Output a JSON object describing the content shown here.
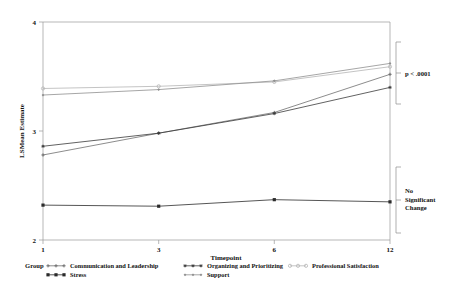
{
  "chart_data": {
    "type": "line",
    "title": "",
    "xlabel": "Timepoint",
    "ylabel": "LSMean Estimate",
    "x": [
      1,
      3,
      6,
      12
    ],
    "xtick_labels": [
      "1",
      "3",
      "6",
      "12"
    ],
    "ytick_labels": [
      "2",
      "3",
      "4"
    ],
    "yticks": [
      2,
      3,
      4
    ],
    "ylim": [
      2,
      4
    ],
    "grid": false,
    "legend_position": "bottom",
    "legend_title": "Group",
    "series": [
      {
        "name": "Communication and Leadership",
        "color": "#6f6f6f",
        "marker": "plus",
        "values": [
          2.78,
          2.98,
          3.17,
          3.52
        ]
      },
      {
        "name": "Organizing and Prioritizing",
        "color": "#3a3a3a",
        "marker": "asterisk",
        "values": [
          2.86,
          2.98,
          3.16,
          3.4
        ]
      },
      {
        "name": "Professional Satisfaction",
        "color": "#b5b5b5",
        "marker": "circle",
        "values": [
          3.39,
          3.41,
          3.45,
          3.59
        ]
      },
      {
        "name": "Stress",
        "color": "#2b2b2b",
        "marker": "square",
        "values": [
          2.32,
          2.31,
          2.37,
          2.35
        ]
      },
      {
        "name": "Support",
        "color": "#8f8f8f",
        "marker": "diamond",
        "values": [
          3.33,
          3.38,
          3.46,
          3.62
        ]
      }
    ],
    "annotations": [
      {
        "id": "upper-bracket",
        "text": "p < .0001",
        "lines": [
          "p < .0001"
        ],
        "span_label": "top three series endpoints"
      },
      {
        "id": "lower-bracket",
        "text": "No Significant Change",
        "lines": [
          "No",
          "Significant",
          "Change"
        ],
        "span_label": "stress series endpoint"
      }
    ]
  },
  "axes": {
    "x_title": "Timepoint",
    "y_title": "LSMean Estimate",
    "x_ticks": [
      "1",
      "3",
      "6",
      "12"
    ],
    "y_ticks": [
      "4",
      "3",
      "2"
    ]
  },
  "legend": {
    "title": "Group",
    "entries": [
      {
        "label": "Communication and Leadership"
      },
      {
        "label": "Organizing and Prioritizing"
      },
      {
        "label": "Professional Satisfaction"
      },
      {
        "label": "Stress"
      },
      {
        "label": "Support"
      }
    ]
  },
  "annotations": {
    "upper": "p < .0001",
    "lower_line1": "No",
    "lower_line2": "Significant",
    "lower_line3": "Change"
  }
}
